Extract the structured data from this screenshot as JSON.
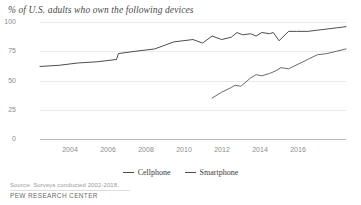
{
  "chart_data": {
    "type": "line",
    "title": "% of U.S. adults who own the following devices",
    "xlabel": "",
    "ylabel": "",
    "ylim": [
      0,
      100
    ],
    "xlim": [
      2002,
      2018
    ],
    "yticks": [
      "100",
      "75",
      "50",
      "25",
      "0"
    ],
    "ytick_values": [
      100,
      75,
      50,
      25,
      0
    ],
    "xticks": [
      "2004",
      "2006",
      "2008",
      "2010",
      "2012",
      "2014",
      "2016"
    ],
    "xtick_values": [
      2004,
      2006,
      2008,
      2010,
      2012,
      2014,
      2016
    ],
    "grid": true,
    "legend_position": "bottom-center",
    "series": [
      {
        "name": "Cellphone",
        "color": "#4d4d4d",
        "x": [
          2002,
          2003,
          2004,
          2005,
          2006,
          2006.1,
          2007,
          2008,
          2009,
          2010,
          2010.5,
          2011,
          2011.5,
          2012,
          2012.3,
          2012.6,
          2013,
          2013.3,
          2013.6,
          2014,
          2014.2,
          2014.5,
          2015,
          2015.4,
          2016,
          2016.5,
          2017,
          2017.5,
          2018
        ],
        "y": [
          62,
          63,
          65,
          66,
          68,
          73,
          75,
          77,
          83,
          85,
          82,
          88,
          85,
          87,
          91,
          89,
          90,
          88,
          91,
          90,
          91,
          84,
          92,
          92,
          92,
          93,
          94,
          95,
          96
        ]
      },
      {
        "name": "Smartphone",
        "color": "#6b6b6b",
        "x": [
          2011,
          2011.5,
          2012,
          2012.2,
          2012.5,
          2013,
          2013.3,
          2013.6,
          2014,
          2014.3,
          2014.6,
          2015,
          2015.5,
          2016,
          2016.5,
          2017,
          2017.5,
          2018
        ],
        "y": [
          35,
          40,
          44,
          46,
          45,
          52,
          55,
          54,
          56,
          58,
          61,
          60,
          64,
          68,
          72,
          73,
          75,
          77
        ]
      }
    ],
    "legend": [
      "Cellphone",
      "Smartphone"
    ]
  },
  "footer": {
    "source": "Source: Surveys conducted 2002-2018.",
    "brand": "PEW RESEARCH CENTER"
  }
}
